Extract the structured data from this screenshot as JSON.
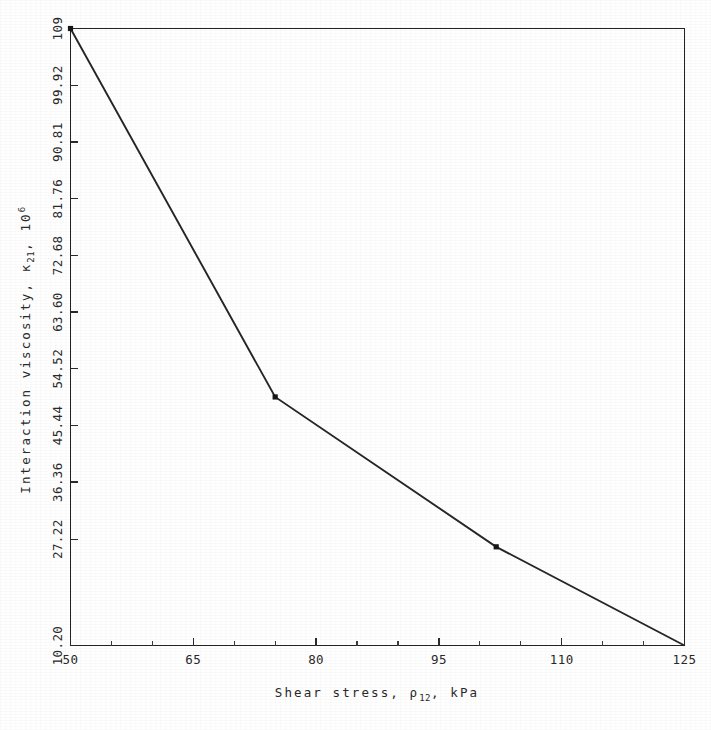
{
  "chart_data": {
    "type": "line",
    "title": "",
    "xlabel": "Shear stress, ρ 12 , kPa",
    "ylabel": "Interaction viscosity, κ 21 , 10 6",
    "xlabel_parts": {
      "pre": "Shear stress, ",
      "symbol": "ρ",
      "sub": "12",
      "post": ", kPa"
    },
    "ylabel_parts": {
      "pre": "Interaction viscosity, ",
      "symbol": "κ",
      "sub": "21",
      "mid": ",  10",
      "sup": "6"
    },
    "x": [
      50,
      75,
      102,
      125
    ],
    "y": [
      109,
      50.0,
      26.0,
      10.2
    ],
    "series": [
      {
        "name": "interaction viscosity vs shear stress",
        "points": [
          {
            "x": 50,
            "y": 109
          },
          {
            "x": 75,
            "y": 50.0
          },
          {
            "x": 102,
            "y": 26.0
          },
          {
            "x": 125,
            "y": 10.2
          }
        ]
      }
    ],
    "xlim": [
      50,
      125
    ],
    "ylim": [
      10.2,
      109
    ],
    "xticks": [
      50,
      65,
      80,
      95,
      110,
      125
    ],
    "xtick_labels": [
      "50",
      "65",
      "80",
      "95",
      "110",
      "125"
    ],
    "xticks_minor": [
      55,
      60,
      70,
      75,
      85,
      90,
      100,
      105,
      115,
      120
    ],
    "yticks": [
      10.2,
      27.22,
      36.36,
      45.44,
      54.52,
      63.6,
      72.68,
      81.76,
      90.81,
      99.92,
      109
    ],
    "ytick_labels": [
      "10.20",
      "27.22",
      "36.36",
      "45.44",
      "54.52",
      "63.60",
      "72.68",
      "81.76",
      "90.81",
      "99.92",
      "109"
    ],
    "grid": false,
    "legend": null,
    "legend_position": "none",
    "line_color": "#262626",
    "frame": true,
    "marker": "point"
  },
  "figure": {
    "background_color": "#ffffff",
    "foreground_color": "#262626"
  }
}
